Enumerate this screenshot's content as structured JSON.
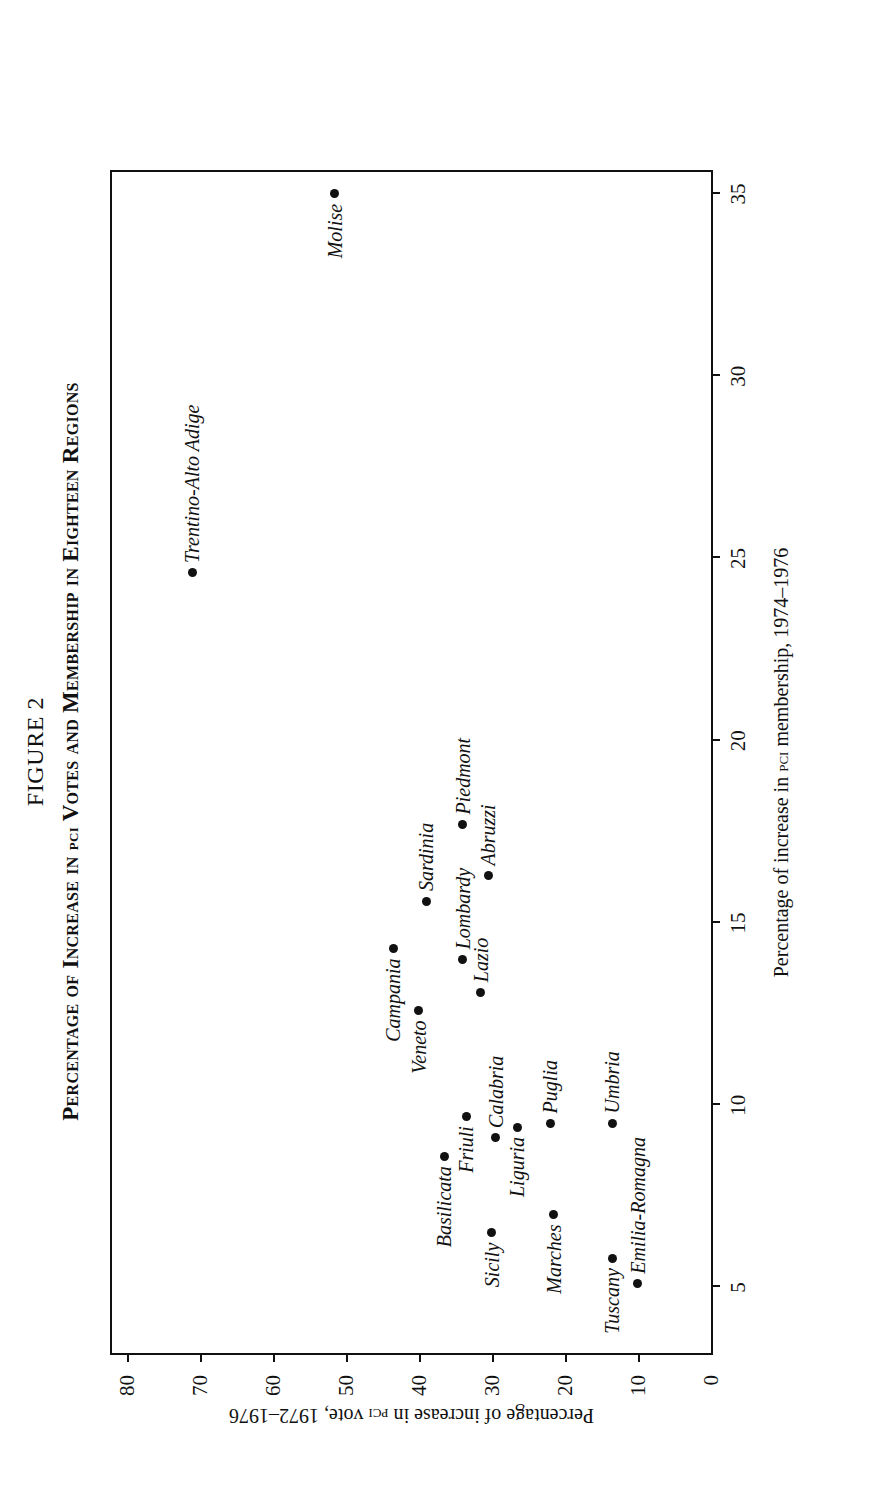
{
  "figure": {
    "number": "FIGURE 2",
    "title_main": "Percentage of Increase in ",
    "title_sc": "pci",
    "title_rest": " Votes and Membership in Eighteen Regions"
  },
  "axes": {
    "x_title_before": "Percentage of increase in ",
    "x_title_sc": "pci",
    "x_title_after": " membership, 1974–1976",
    "y_title_before": "Percentage of increase in ",
    "y_title_sc": "pci",
    "y_title_after": " vote, 1972–1976"
  },
  "chart_data": {
    "type": "scatter",
    "title": "Percentage of Increase in PCI Votes and Membership in Eighteen Regions",
    "xlabel": "Percentage of increase in PCI membership, 1974–1976",
    "ylabel": "Percentage of increase in PCI vote, 1972–1976",
    "xlim": [
      3.2,
      35.6
    ],
    "ylim": [
      0,
      82
    ],
    "xticks": [
      5,
      10,
      15,
      20,
      25,
      30,
      35
    ],
    "xtick_labels": [
      "5",
      "10",
      "15",
      "20",
      "25",
      "30",
      "35"
    ],
    "yticks": [
      0,
      10,
      20,
      30,
      40,
      50,
      60,
      70,
      80
    ],
    "ytick_labels": [
      "0",
      "10",
      "20",
      "30",
      "40",
      "50",
      "60",
      "70",
      "80"
    ],
    "grid": false,
    "legend": null,
    "points": [
      {
        "label": "Molise",
        "x": 35.0,
        "y": 51.5,
        "label_pos": "left"
      },
      {
        "label": "Trentino-Alto Adige",
        "x": 24.6,
        "y": 71.0,
        "label_pos": "right"
      },
      {
        "label": "Sardinia",
        "x": 15.6,
        "y": 39.0,
        "label_pos": "right"
      },
      {
        "label": "Campania",
        "x": 14.3,
        "y": 43.5,
        "label_pos": "left"
      },
      {
        "label": "Piedmont",
        "x": 17.7,
        "y": 34.0,
        "label_pos": "right"
      },
      {
        "label": "Lombardy",
        "x": 14.0,
        "y": 34.0,
        "label_pos": "right"
      },
      {
        "label": "Veneto",
        "x": 12.6,
        "y": 40.0,
        "label_pos": "left"
      },
      {
        "label": "Abruzzi",
        "x": 16.3,
        "y": 30.5,
        "label_pos": "right"
      },
      {
        "label": "Lazio",
        "x": 13.1,
        "y": 31.5,
        "label_pos": "right"
      },
      {
        "label": "Friuli",
        "x": 9.7,
        "y": 33.5,
        "label_pos": "left"
      },
      {
        "label": "Basilicata",
        "x": 8.6,
        "y": 36.5,
        "label_pos": "left"
      },
      {
        "label": "Calabria",
        "x": 9.1,
        "y": 29.5,
        "label_pos": "right"
      },
      {
        "label": "Puglia",
        "x": 9.5,
        "y": 22.0,
        "label_pos": "right"
      },
      {
        "label": "Liguria",
        "x": 9.4,
        "y": 26.5,
        "label_pos": "left"
      },
      {
        "label": "Sicily",
        "x": 6.5,
        "y": 30.0,
        "label_pos": "left"
      },
      {
        "label": "Marches",
        "x": 7.0,
        "y": 21.5,
        "label_pos": "left"
      },
      {
        "label": "Umbria",
        "x": 9.5,
        "y": 13.5,
        "label_pos": "right"
      },
      {
        "label": "Tuscany",
        "x": 5.8,
        "y": 13.5,
        "label_pos": "left"
      },
      {
        "label": "Emilia-Romagna",
        "x": 5.1,
        "y": 10.0,
        "label_pos": "right"
      }
    ]
  }
}
